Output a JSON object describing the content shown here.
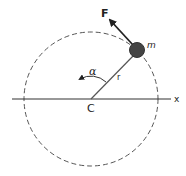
{
  "diagram": {
    "type": "circular-motion",
    "labels": {
      "force": "F",
      "mass": "m",
      "angle": "α",
      "radius": "r",
      "center": "C",
      "axis": "x"
    },
    "colors": {
      "line": "#333333",
      "circle_dash": "#555555",
      "mass_fill": "#444444",
      "background": "#ffffff"
    }
  }
}
